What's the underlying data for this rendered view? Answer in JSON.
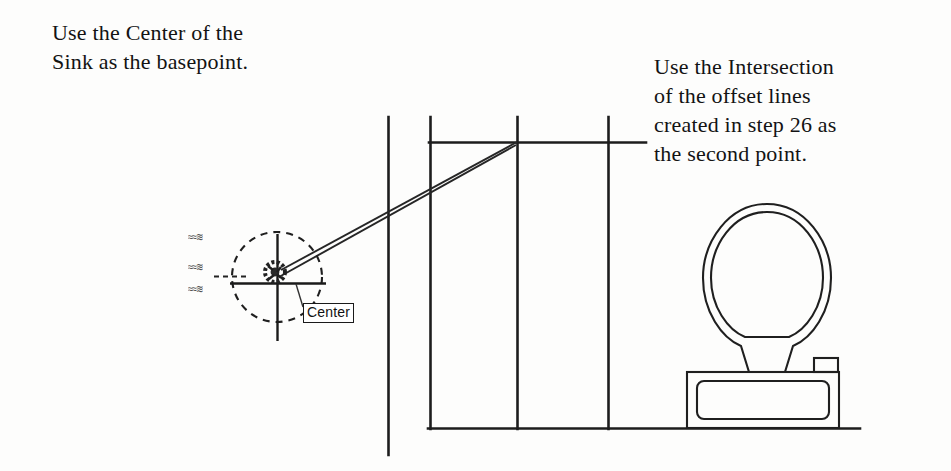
{
  "figure": {
    "background_color": "#fdfdfc",
    "ink_color": "#1a1a1a"
  },
  "annotations": {
    "left_note": "Use the Center of the\nSink as the basepoint.",
    "right_note": "Use the Intersection\nof the offset lines\ncreated in step 26 as\nthe second point."
  },
  "drawing": {
    "osnap_tooltip": {
      "label": "Center",
      "x": 303,
      "y": 303
    },
    "sink": {
      "name": "sink-circle",
      "center_x": 277,
      "center_y": 277,
      "radius": 45,
      "linetype": "dashed"
    },
    "crosshair": {
      "name": "crosshair-cursor",
      "center_x": 277,
      "center_y": 277,
      "horizontal_from_x": 230,
      "horizontal_to_x": 326,
      "vertical_from_y": 234,
      "vertical_to_y": 341
    },
    "snap_marker": {
      "name": "center-snap-marker",
      "x": 273,
      "y": 272,
      "radius": 9
    },
    "rubber_band": {
      "name": "rubber-band-preview",
      "from_x": 277,
      "from_y": 272,
      "to_x": 517,
      "to_y": 142
    },
    "wall_lines": {
      "verticals": [
        {
          "x": 388,
          "y1": 117,
          "y2": 455
        },
        {
          "x": 430,
          "y1": 117,
          "y2": 428
        },
        {
          "x": 517,
          "y1": 117,
          "y2": 428
        },
        {
          "x": 608,
          "y1": 117,
          "y2": 428
        }
      ],
      "horizontals": [
        {
          "y": 142,
          "x1": 430,
          "x2": 646
        },
        {
          "y": 428,
          "x1": 428,
          "x2": 860
        }
      ],
      "intersection_point": {
        "x": 517,
        "y": 142
      }
    },
    "toilet": {
      "name": "toilet-fixture",
      "bowl": {
        "x": 703,
        "y": 204,
        "width": 128,
        "height": 137
      },
      "tank": {
        "x": 687,
        "y": 372,
        "width": 152,
        "height": 56
      },
      "flush_handle": {
        "x": 814,
        "y": 358,
        "width": 24,
        "height": 14
      }
    },
    "smudges": [
      "≈≈≋",
      "≈≈≋",
      "≈≈≋"
    ]
  }
}
